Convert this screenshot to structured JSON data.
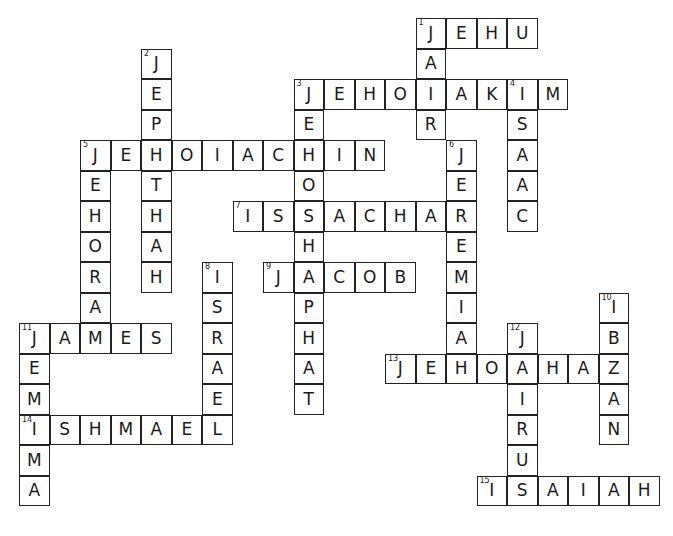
{
  "puzzle": {
    "type": "crossword",
    "cell_size": 30.5,
    "origin": {
      "x": 19,
      "y": 18
    },
    "entries": [
      {
        "number": 1,
        "direction": "across",
        "row": 0,
        "col": 13,
        "answer": "JEHU"
      },
      {
        "number": 1,
        "direction": "down",
        "row": 0,
        "col": 13,
        "answer": "JAIR"
      },
      {
        "number": 2,
        "direction": "down",
        "row": 1,
        "col": 4,
        "answer": "JEPHTHAH"
      },
      {
        "number": 3,
        "direction": "across",
        "row": 2,
        "col": 9,
        "answer": "JEHOIAKIM"
      },
      {
        "number": 3,
        "direction": "down",
        "row": 2,
        "col": 9,
        "answer": "JEHOSHAPHAT"
      },
      {
        "number": 4,
        "direction": "down",
        "row": 2,
        "col": 16,
        "answer": "ISAAC"
      },
      {
        "number": 5,
        "direction": "across",
        "row": 4,
        "col": 2,
        "answer": "JEHOIACHIN"
      },
      {
        "number": 5,
        "direction": "down",
        "row": 4,
        "col": 2,
        "answer": "JEHORAM"
      },
      {
        "number": 6,
        "direction": "down",
        "row": 4,
        "col": 14,
        "answer": "JEREMIAH"
      },
      {
        "number": 7,
        "direction": "across",
        "row": 6,
        "col": 7,
        "answer": "ISSACHAR"
      },
      {
        "number": 8,
        "direction": "down",
        "row": 8,
        "col": 6,
        "answer": "ISRAEL"
      },
      {
        "number": 9,
        "direction": "across",
        "row": 8,
        "col": 8,
        "answer": "JACOB"
      },
      {
        "number": 10,
        "direction": "down",
        "row": 9,
        "col": 19,
        "answer": "IBZAN"
      },
      {
        "number": 11,
        "direction": "across",
        "row": 10,
        "col": 0,
        "answer": "JAMES"
      },
      {
        "number": 11,
        "direction": "down",
        "row": 10,
        "col": 0,
        "answer": "JEMIMA"
      },
      {
        "number": 12,
        "direction": "down",
        "row": 10,
        "col": 16,
        "answer": "JAIRUS"
      },
      {
        "number": 13,
        "direction": "across",
        "row": 11,
        "col": 12,
        "answer": "JEHOAHAZ"
      },
      {
        "number": 14,
        "direction": "across",
        "row": 13,
        "col": 0,
        "answer": "ISHMAEL"
      },
      {
        "number": 15,
        "direction": "across",
        "row": 15,
        "col": 15,
        "answer": "ISAIAH"
      }
    ]
  }
}
